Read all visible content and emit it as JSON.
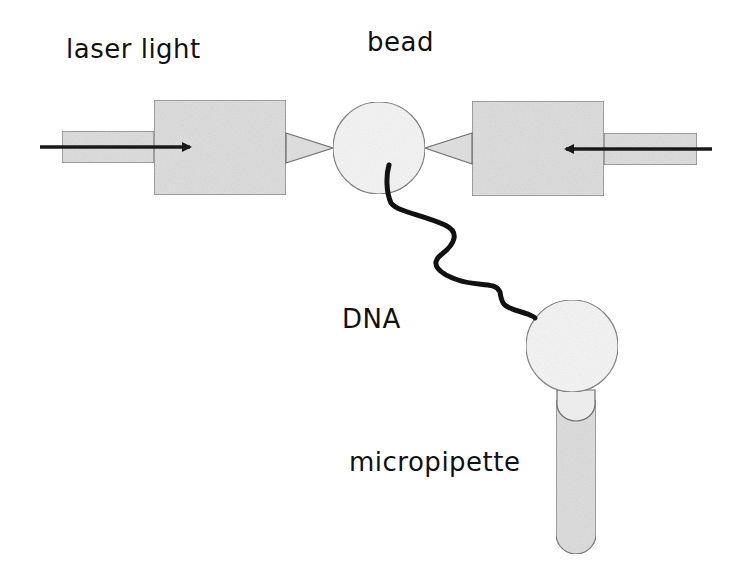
{
  "diagram": {
    "labels": {
      "laser": "laser light",
      "bead": "bead",
      "dna": "DNA",
      "pipette": "micropipette"
    },
    "colors": {
      "background": "#ffffff",
      "box_fill": "#dcdcdc",
      "box_stroke": "#6e6e6e",
      "bead_fill": "#f4f4f4",
      "dna_stroke": "#111111",
      "arrow": "#1a1a1a",
      "text": "#111111"
    },
    "components": [
      {
        "id": "left-laser",
        "type": "laser-objective",
        "direction": "right"
      },
      {
        "id": "right-laser",
        "type": "laser-objective",
        "direction": "left"
      },
      {
        "id": "trapped-bead",
        "type": "bead"
      },
      {
        "id": "pipette-bead",
        "type": "bead"
      },
      {
        "id": "dna-strand",
        "type": "dna"
      },
      {
        "id": "micropipette",
        "type": "pipette"
      }
    ]
  }
}
